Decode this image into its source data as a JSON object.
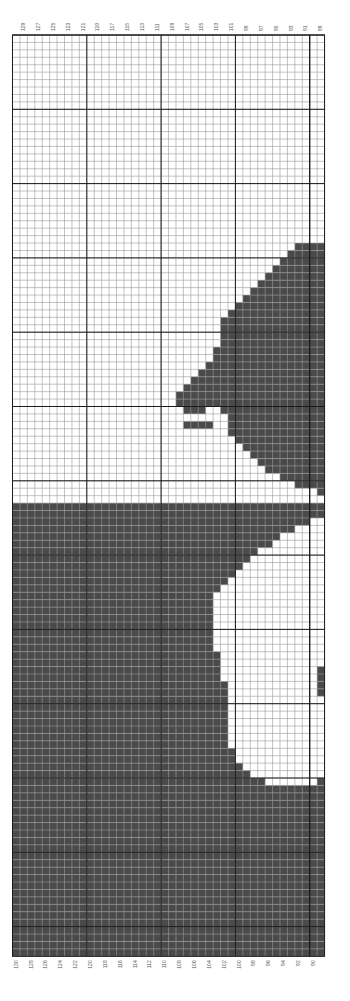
{
  "chart_data": {
    "type": "heatmap",
    "title": "",
    "colors": {
      "filled": "#4a4a4a",
      "empty": "#ffffff",
      "minor_grid": "#9a9a9a",
      "major_grid": "#1a1a1a"
    },
    "columns": 42,
    "rows": 124,
    "major_grid_every": 10,
    "top_labels": [
      "129",
      "127",
      "125",
      "123",
      "121",
      "119",
      "117",
      "115",
      "113",
      "111",
      "109",
      "107",
      "105",
      "103",
      "101",
      "99",
      "97",
      "95",
      "93",
      "91",
      "89"
    ],
    "bottom_labels": [
      "130",
      "128",
      "126",
      "124",
      "122",
      "120",
      "118",
      "116",
      "114",
      "112",
      "110",
      "108",
      "106",
      "104",
      "102",
      "100",
      "98",
      "96",
      "94",
      "92",
      "90"
    ],
    "label_range": [
      89,
      130
    ],
    "filled_runs_note": "Each entry: [row, startCol, endCol] inclusive, columns 0-41 left to right, rows 0 top",
    "filled_runs": [
      [
        28,
        38,
        41
      ],
      [
        29,
        37,
        41
      ],
      [
        30,
        36,
        41
      ],
      [
        31,
        35,
        41
      ],
      [
        32,
        34,
        41
      ],
      [
        33,
        33,
        41
      ],
      [
        34,
        32,
        41
      ],
      [
        35,
        31,
        41
      ],
      [
        36,
        30,
        41
      ],
      [
        37,
        29,
        41
      ],
      [
        38,
        28,
        41
      ],
      [
        39,
        28,
        41
      ],
      [
        40,
        28,
        41
      ],
      [
        41,
        28,
        41
      ],
      [
        42,
        27,
        41
      ],
      [
        43,
        27,
        41
      ],
      [
        44,
        26,
        41
      ],
      [
        45,
        25,
        41
      ],
      [
        46,
        24,
        41
      ],
      [
        47,
        23,
        41
      ],
      [
        48,
        22,
        41
      ],
      [
        49,
        22,
        41
      ],
      [
        50,
        23,
        25
      ],
      [
        50,
        28,
        41
      ],
      [
        51,
        29,
        41
      ],
      [
        52,
        23,
        26
      ],
      [
        52,
        29,
        41
      ],
      [
        53,
        29,
        41
      ],
      [
        54,
        30,
        41
      ],
      [
        55,
        31,
        41
      ],
      [
        56,
        32,
        41
      ],
      [
        57,
        33,
        41
      ],
      [
        58,
        34,
        41
      ],
      [
        59,
        36,
        41
      ],
      [
        60,
        38,
        41
      ],
      [
        61,
        41,
        41
      ],
      [
        63,
        0,
        41
      ],
      [
        64,
        0,
        41
      ],
      [
        65,
        0,
        39
      ],
      [
        66,
        0,
        37
      ],
      [
        67,
        0,
        35
      ],
      [
        68,
        0,
        34
      ],
      [
        69,
        0,
        32
      ],
      [
        70,
        0,
        31
      ],
      [
        71,
        0,
        30
      ],
      [
        72,
        0,
        29
      ],
      [
        73,
        0,
        28
      ],
      [
        74,
        0,
        27
      ],
      [
        75,
        0,
        26
      ],
      [
        76,
        0,
        26
      ],
      [
        77,
        0,
        26
      ],
      [
        78,
        0,
        26
      ],
      [
        79,
        0,
        26
      ],
      [
        80,
        0,
        26
      ],
      [
        81,
        0,
        26
      ],
      [
        82,
        0,
        26
      ],
      [
        83,
        0,
        27
      ],
      [
        84,
        0,
        27
      ],
      [
        85,
        0,
        27
      ],
      [
        85,
        41,
        41
      ],
      [
        86,
        0,
        27
      ],
      [
        86,
        41,
        41
      ],
      [
        87,
        0,
        28
      ],
      [
        87,
        41,
        41
      ],
      [
        88,
        0,
        28
      ],
      [
        88,
        41,
        41
      ],
      [
        89,
        0,
        28
      ],
      [
        90,
        0,
        28
      ],
      [
        91,
        0,
        28
      ],
      [
        92,
        0,
        28
      ],
      [
        93,
        0,
        28
      ],
      [
        94,
        0,
        28
      ],
      [
        95,
        0,
        28
      ],
      [
        96,
        0,
        29
      ],
      [
        97,
        0,
        29
      ],
      [
        98,
        0,
        30
      ],
      [
        99,
        0,
        31
      ],
      [
        100,
        0,
        33
      ],
      [
        100,
        41,
        41
      ],
      [
        101,
        0,
        41
      ],
      [
        102,
        0,
        41
      ],
      [
        103,
        0,
        41
      ],
      [
        104,
        0,
        41
      ],
      [
        105,
        0,
        41
      ],
      [
        106,
        0,
        41
      ],
      [
        107,
        0,
        41
      ],
      [
        108,
        0,
        41
      ],
      [
        109,
        0,
        41
      ],
      [
        110,
        0,
        41
      ],
      [
        111,
        0,
        41
      ],
      [
        112,
        0,
        41
      ],
      [
        113,
        0,
        41
      ],
      [
        114,
        0,
        41
      ],
      [
        115,
        0,
        41
      ],
      [
        116,
        0,
        41
      ],
      [
        117,
        0,
        41
      ],
      [
        118,
        0,
        41
      ],
      [
        119,
        0,
        41
      ],
      [
        120,
        0,
        41
      ],
      [
        121,
        0,
        41
      ],
      [
        122,
        0,
        41
      ],
      [
        123,
        0,
        41
      ]
    ]
  },
  "layout": {
    "origin_x": 12.5,
    "origin_y": 35,
    "cell": 7.43
  }
}
